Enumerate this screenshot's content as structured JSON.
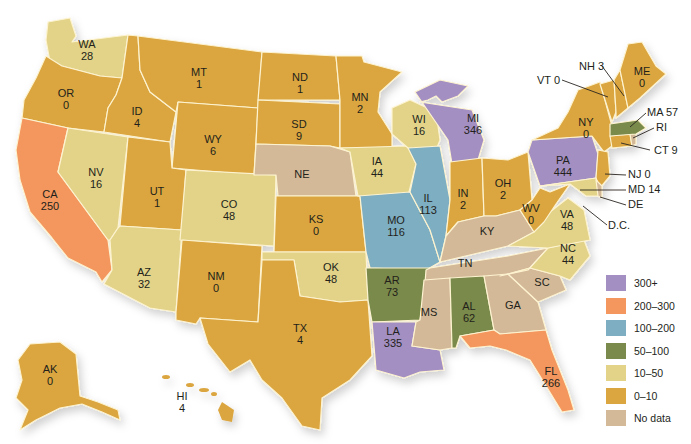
{
  "legend": {
    "items": [
      {
        "label": "300+",
        "color": "#a48fc2"
      },
      {
        "label": "200–300",
        "color": "#f4975f"
      },
      {
        "label": "100–200",
        "color": "#7eaec2"
      },
      {
        "label": "50–100",
        "color": "#7a8a4c"
      },
      {
        "label": "10–50",
        "color": "#e2d388"
      },
      {
        "label": "0–10",
        "color": "#dba640"
      },
      {
        "label": "No data",
        "color": "#d4b998"
      }
    ]
  },
  "states": {
    "WA": {
      "abbr": "WA",
      "value": "28",
      "category": "10–50"
    },
    "OR": {
      "abbr": "OR",
      "value": "0",
      "category": "0–10"
    },
    "CA": {
      "abbr": "CA",
      "value": "250",
      "category": "200–300"
    },
    "ID": {
      "abbr": "ID",
      "value": "4",
      "category": "0–10"
    },
    "NV": {
      "abbr": "NV",
      "value": "16",
      "category": "10–50"
    },
    "MT": {
      "abbr": "MT",
      "value": "1",
      "category": "0–10"
    },
    "WY": {
      "abbr": "WY",
      "value": "6",
      "category": "0–10"
    },
    "UT": {
      "abbr": "UT",
      "value": "1",
      "category": "0–10"
    },
    "AZ": {
      "abbr": "AZ",
      "value": "32",
      "category": "10–50"
    },
    "CO": {
      "abbr": "CO",
      "value": "48",
      "category": "10–50"
    },
    "NM": {
      "abbr": "NM",
      "value": "0",
      "category": "0–10"
    },
    "ND": {
      "abbr": "ND",
      "value": "1",
      "category": "0–10"
    },
    "SD": {
      "abbr": "SD",
      "value": "9",
      "category": "0–10"
    },
    "NE": {
      "abbr": "NE",
      "value": "",
      "category": "No data"
    },
    "KS": {
      "abbr": "KS",
      "value": "0",
      "category": "0–10"
    },
    "OK": {
      "abbr": "OK",
      "value": "48",
      "category": "10–50"
    },
    "TX": {
      "abbr": "TX",
      "value": "4",
      "category": "0–10"
    },
    "MN": {
      "abbr": "MN",
      "value": "2",
      "category": "0–10"
    },
    "IA": {
      "abbr": "IA",
      "value": "44",
      "category": "10–50"
    },
    "MO": {
      "abbr": "MO",
      "value": "116",
      "category": "100–200"
    },
    "AR": {
      "abbr": "AR",
      "value": "73",
      "category": "50–100"
    },
    "LA": {
      "abbr": "LA",
      "value": "335",
      "category": "300+"
    },
    "WI": {
      "abbr": "WI",
      "value": "16",
      "category": "10–50"
    },
    "IL": {
      "abbr": "IL",
      "value": "113",
      "category": "100–200"
    },
    "MI": {
      "abbr": "MI",
      "value": "346",
      "category": "300+"
    },
    "IN": {
      "abbr": "IN",
      "value": "2",
      "category": "0–10"
    },
    "OH": {
      "abbr": "OH",
      "value": "2",
      "category": "0–10"
    },
    "KY": {
      "abbr": "KY",
      "value": "",
      "category": "No data"
    },
    "TN": {
      "abbr": "TN",
      "value": "",
      "category": "No data"
    },
    "MS": {
      "abbr": "MS",
      "value": "",
      "category": "No data"
    },
    "AL": {
      "abbr": "AL",
      "value": "62",
      "category": "50–100"
    },
    "GA": {
      "abbr": "GA",
      "value": "",
      "category": "No data"
    },
    "FL": {
      "abbr": "FL",
      "value": "266",
      "category": "200–300"
    },
    "SC": {
      "abbr": "SC",
      "value": "",
      "category": "No data"
    },
    "NC": {
      "abbr": "NC",
      "value": "44",
      "category": "10–50"
    },
    "VA": {
      "abbr": "VA",
      "value": "48",
      "category": "10–50"
    },
    "WV": {
      "abbr": "WV",
      "value": "0",
      "category": "0–10"
    },
    "PA": {
      "abbr": "PA",
      "value": "444",
      "category": "300+"
    },
    "NY": {
      "abbr": "NY",
      "value": "0",
      "category": "0–10"
    },
    "ME": {
      "abbr": "ME",
      "value": "0",
      "category": "0–10"
    },
    "AK": {
      "abbr": "AK",
      "value": "0",
      "category": "0–10"
    },
    "HI": {
      "abbr": "HI",
      "value": "4",
      "category": "0–10"
    }
  },
  "callouts": {
    "VT": "VT 0",
    "NH": "NH 3",
    "MA": "MA 57",
    "RI": "RI",
    "CT": "CT 9",
    "NJ": "NJ 0",
    "MD": "MD 14",
    "DE": "DE",
    "DC": "D.C."
  }
}
